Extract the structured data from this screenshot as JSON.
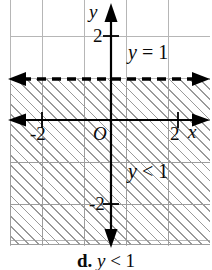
{
  "figure": {
    "type": "coordinate-plane-inequality-graph",
    "caption": {
      "letter": "d.",
      "expression_variable": "y",
      "expression_operator": "<",
      "expression_value": "1",
      "full": "d. y < 1"
    },
    "axes": {
      "x_label": "x",
      "y_label": "y",
      "origin_label": "O",
      "x_ticks": [
        "-2",
        "2"
      ],
      "y_ticks": [
        "2",
        "-2"
      ],
      "x_range": [
        -2.6,
        2.4
      ],
      "y_range": [
        -2.9,
        2.9
      ],
      "grid": true,
      "grid_color": "#b6b6b6",
      "axis_color": "#000000"
    },
    "boundary_line": {
      "label_variable": "y",
      "label_operator": "=",
      "label_value": "1",
      "label_full": "y = 1",
      "style": "dashed",
      "y_value": 1,
      "color": "#000000",
      "arrows_both_ends": true
    },
    "shaded_region": {
      "label_variable": "y",
      "label_operator": "<",
      "label_value": "1",
      "label_full": "y < 1",
      "description": "half-plane below y = 1",
      "fill": "diagonal-hatch",
      "hatch_color": "#9a9a9a"
    }
  }
}
